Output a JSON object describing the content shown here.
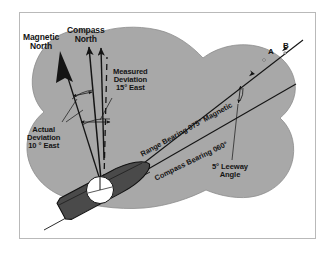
{
  "figure": {
    "type": "navigation-deviation-diagram",
    "colors": {
      "land_fill": "#a8a8a8",
      "land_stroke": "#6f6f6f",
      "hull_fill": "#4a4a4a",
      "hull_stroke": "#1a1a1a",
      "compass_rose_fill": "#ffffff",
      "line": "#141414",
      "frame": "#b9b9b9",
      "background": "#ffffff"
    },
    "labels": {
      "magnetic_north": "Magnetic\nNorth",
      "compass_north": "Compass\nNorth",
      "measured_deviation": "Measured\nDeviation\n15° East",
      "actual_deviation": "Actual\nDeviation\n10 ° East",
      "range_bearing": "Range Bearing 075° Magnetic",
      "compass_bearing": "Compass Bearing 060°",
      "leeway_angle": "5° Leeway\nAngle",
      "point_a": "A",
      "point_b": "B"
    }
  }
}
